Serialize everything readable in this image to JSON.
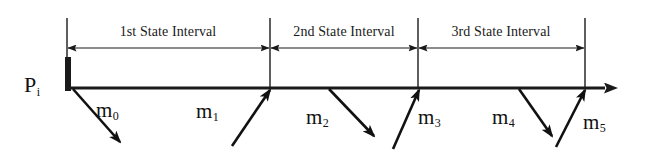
{
  "figure": {
    "type": "timeline-impulse-diagram",
    "background_color": "#ffffff",
    "stroke_color": "#1a1a1a"
  },
  "axis": {
    "name": "time-axis",
    "start_x": 67,
    "end_x": 617,
    "y": 88,
    "arrow_head": "right"
  },
  "origin_marker": {
    "label_main": "P",
    "label_sub": "i",
    "bar_x": 68,
    "bar_top": 57,
    "bar_bottom": 91
  },
  "boundaries": [
    {
      "name": "boundary-0",
      "x": 67,
      "top": 18,
      "bottom": 88
    },
    {
      "name": "boundary-1",
      "x": 270,
      "top": 18,
      "bottom": 88
    },
    {
      "name": "boundary-2",
      "x": 418,
      "top": 18,
      "bottom": 88
    },
    {
      "name": "boundary-3",
      "x": 585,
      "top": 18,
      "bottom": 88
    }
  ],
  "intervals": [
    {
      "label": "1st State Interval",
      "start_x": 67,
      "end_x": 270,
      "dim_line_y": 48,
      "label_center_x": 168,
      "label_y": 24
    },
    {
      "label": "2nd State Interval",
      "start_x": 270,
      "end_x": 418,
      "dim_line_y": 48,
      "label_center_x": 344,
      "label_y": 24
    },
    {
      "label": "3rd State Interval",
      "start_x": 418,
      "end_x": 585,
      "dim_line_y": 48,
      "label_center_x": 501,
      "label_y": 24
    }
  ],
  "impulses": [
    {
      "label_main": "m",
      "label_sub": "0",
      "direction": "down-right",
      "x1": 73,
      "y1": 89,
      "x2": 120,
      "y2": 142,
      "label_x": 96,
      "label_y": 100
    },
    {
      "label_main": "m",
      "label_sub": "1",
      "direction": "up-right",
      "x1": 232,
      "y1": 146,
      "x2": 270,
      "y2": 90,
      "label_x": 196,
      "label_y": 101
    },
    {
      "label_main": "m",
      "label_sub": "2",
      "direction": "down-right",
      "x1": 329,
      "y1": 89,
      "x2": 374,
      "y2": 136,
      "label_x": 306,
      "label_y": 107
    },
    {
      "label_main": "m",
      "label_sub": "3",
      "direction": "up-right",
      "x1": 393,
      "y1": 149,
      "x2": 419,
      "y2": 90,
      "label_x": 418,
      "label_y": 107
    },
    {
      "label_main": "m",
      "label_sub": "4",
      "direction": "down-right",
      "x1": 519,
      "y1": 89,
      "x2": 552,
      "y2": 136,
      "label_x": 492,
      "label_y": 107
    },
    {
      "label_main": "m",
      "label_sub": "5",
      "direction": "up-right",
      "x1": 556,
      "y1": 147,
      "x2": 585,
      "y2": 90,
      "label_x": 583,
      "label_y": 112
    }
  ]
}
